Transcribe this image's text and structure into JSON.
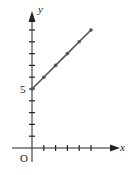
{
  "chart_data": {
    "type": "line",
    "title": "",
    "xlabel": "x",
    "ylabel": "y",
    "origin_label": "O",
    "y_tick_labels": [
      {
        "value": 5,
        "label": "5"
      }
    ],
    "x": [
      0,
      1,
      2,
      3,
      4,
      5
    ],
    "series": [
      {
        "name": "line",
        "values": [
          5,
          6,
          7,
          8,
          9,
          10
        ],
        "markers": true
      }
    ],
    "xlim": [
      0,
      5
    ],
    "ylim": [
      0,
      10
    ],
    "x_ticks": [
      1,
      2,
      3,
      4,
      5
    ],
    "y_ticks": [
      1,
      2,
      3,
      4,
      5,
      6,
      7,
      8,
      9,
      10
    ],
    "grid": false,
    "legend": "none",
    "colors": {
      "axis": "#222222",
      "line": "#555555",
      "marker": "#555555"
    }
  },
  "labels": {
    "x_axis": "x",
    "y_axis": "y",
    "origin": "O",
    "y_value_5": "5"
  }
}
